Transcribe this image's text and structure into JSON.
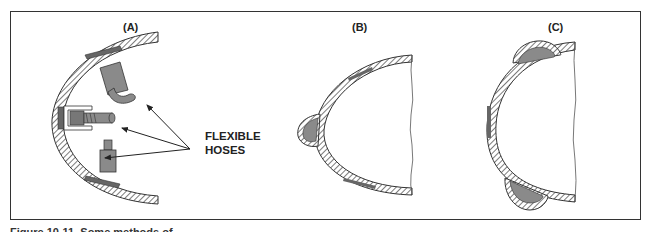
{
  "figure": {
    "caption": "Figure 10-11. Some methods of",
    "panels": [
      {
        "id": "A",
        "label": "(A)",
        "description": "Curved hull section with three components attached via flexible hoses"
      },
      {
        "id": "B",
        "label": "(B)",
        "description": "Curved hull section with one shaded bulge on the left side"
      },
      {
        "id": "C",
        "label": "(C)",
        "description": "Curved hull section with two shaded bulges, top and bottom"
      }
    ],
    "callout": {
      "line1": "FLEXIBLE",
      "line2": "HOSES",
      "arrow_count": 3
    },
    "colors": {
      "outline": "#333333",
      "fill_gray": "#8a8a8a",
      "hatch": "#444444",
      "background": "#ffffff"
    }
  }
}
